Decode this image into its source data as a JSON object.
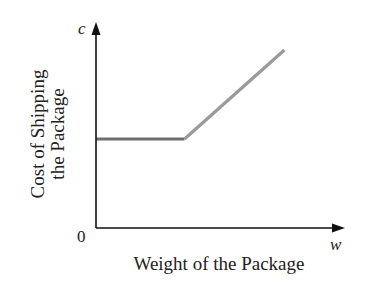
{
  "chart_data": {
    "type": "line",
    "title": "",
    "xlabel": "Weight of the Package",
    "ylabel": [
      "Cost of Shipping",
      "the Package"
    ],
    "x_var": "w",
    "y_var": "c",
    "origin_label": "0",
    "xlim": [
      0,
      10
    ],
    "ylim": [
      0,
      10
    ],
    "grid": false,
    "legend": "none",
    "series": [
      {
        "name": "flat-rate segment",
        "color": "#6e6e6e",
        "points": [
          [
            0,
            4.3
          ],
          [
            3.9,
            4.3
          ]
        ]
      },
      {
        "name": "increasing segment",
        "color": "#9a9a9a",
        "points": [
          [
            3.9,
            4.3
          ],
          [
            8.3,
            8.6
          ]
        ]
      }
    ],
    "colors": {
      "axis": "#111111",
      "text": "#222222"
    }
  }
}
